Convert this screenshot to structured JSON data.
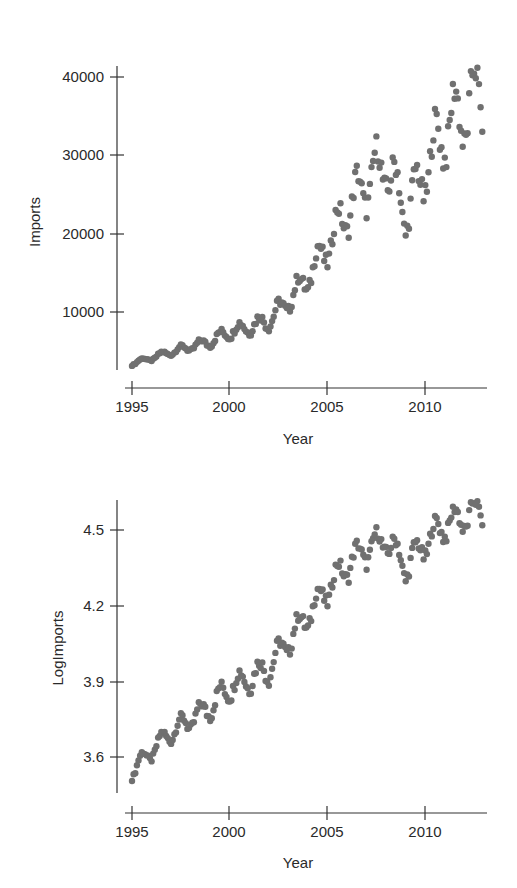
{
  "colors": {
    "dot": "#707070",
    "axis": "#333333",
    "text": "#2a2a2a"
  },
  "chart_data": [
    {
      "type": "scatter",
      "title": "",
      "xlabel": "Year",
      "ylabel": "Imports",
      "xlim": [
        1995,
        2013
      ],
      "ylim": [
        2500,
        41000
      ],
      "x_ticks": [
        "1995",
        "2000",
        "2005",
        "2010"
      ],
      "y_ticks": [
        "10000",
        "20000",
        "30000",
        "40000"
      ],
      "grid": false,
      "legend": null,
      "description": "Monthly imports, 1995-2013, strong upward exponential trend with seasonal oscillation; values from ~3000 in 1995 to ~40000 in 2013, dip near 2009 (~19000)",
      "annual_approx": {
        "x": [
          1995,
          1996,
          1997,
          1998,
          1999,
          2000,
          2001,
          2002,
          2003,
          2004,
          2005,
          2006,
          2007,
          2008,
          2009,
          2010,
          2011,
          2012,
          2013
        ],
        "values": [
          3500,
          4200,
          5000,
          5600,
          6300,
          7600,
          8200,
          9000,
          11500,
          14500,
          18500,
          23000,
          26500,
          29000,
          22500,
          28000,
          33500,
          35500,
          38500
        ]
      }
    },
    {
      "type": "scatter",
      "title": "",
      "xlabel": "Year",
      "ylabel": "LogImports",
      "xlim": [
        1995,
        2013
      ],
      "ylim": [
        3.45,
        4.62
      ],
      "x_ticks": [
        "1995",
        "2000",
        "2005",
        "2010"
      ],
      "y_ticks": [
        "3.6",
        "3.9",
        "4.2",
        "4.5"
      ],
      "grid": false,
      "legend": null,
      "description": "log10 of monthly imports; near-linear upward trend from ~3.5 in 1995 to ~4.58 in 2013",
      "annual_approx": {
        "x": [
          1995,
          1996,
          1997,
          1998,
          1999,
          2000,
          2001,
          2002,
          2003,
          2004,
          2005,
          2006,
          2007,
          2008,
          2009,
          2010,
          2011,
          2012,
          2013
        ],
        "values": [
          3.54,
          3.62,
          3.7,
          3.75,
          3.8,
          3.88,
          3.91,
          3.95,
          4.06,
          4.16,
          4.27,
          4.36,
          4.42,
          4.46,
          4.35,
          4.45,
          4.52,
          4.55,
          4.58
        ]
      }
    }
  ],
  "top_chart": {
    "ylabel": "Imports",
    "xlabel": "Year",
    "y_ticks": [
      {
        "label": "40000",
        "y": 77
      },
      {
        "label": "30000",
        "y": 155
      },
      {
        "label": "20000",
        "y": 234
      },
      {
        "label": "10000",
        "y": 312
      }
    ],
    "x_ticks": [
      {
        "label": "1995",
        "x": 132
      },
      {
        "label": "2000",
        "x": 229
      },
      {
        "label": "2005",
        "x": 327
      },
      {
        "label": "2010",
        "x": 425
      }
    ]
  },
  "bottom_chart": {
    "ylabel": "LogImports",
    "xlabel": "Year",
    "y_ticks": [
      {
        "label": "4.5",
        "y": 530
      },
      {
        "label": "4.2",
        "y": 606
      },
      {
        "label": "3.9",
        "y": 682
      },
      {
        "label": "3.6",
        "y": 757
      }
    ],
    "x_ticks": [
      {
        "label": "1995",
        "x": 132
      },
      {
        "label": "2000",
        "x": 229
      },
      {
        "label": "2005",
        "x": 327
      },
      {
        "label": "2010",
        "x": 425
      }
    ]
  }
}
